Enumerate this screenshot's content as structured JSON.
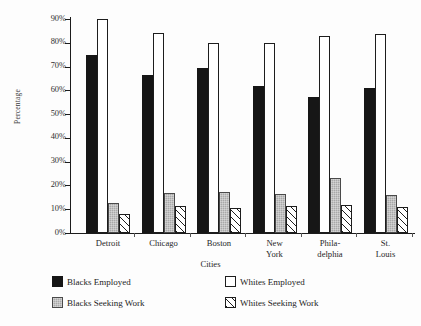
{
  "chart_data": {
    "type": "bar",
    "title": "",
    "xlabel": "Cities",
    "ylabel": "Percentage",
    "categories": [
      "Detroit",
      "Chicago",
      "Boston",
      "New York",
      "Phila-delphia",
      "St. Louis"
    ],
    "category_lines": [
      [
        "Detroit"
      ],
      [
        "Chicago"
      ],
      [
        "Boston"
      ],
      [
        "New",
        "York"
      ],
      [
        "Phila-",
        "delphia"
      ],
      [
        "St.",
        "Louis"
      ]
    ],
    "series": [
      {
        "name": "Blacks Employed",
        "swatch": "sw-blacks-employed",
        "values": [
          75,
          66.5,
          69.5,
          62,
          57,
          61
        ]
      },
      {
        "name": "Whites Employed",
        "swatch": "sw-whites-employed",
        "values": [
          90,
          84,
          80,
          80,
          83,
          83.5
        ]
      },
      {
        "name": "Blacks Seeking Work",
        "swatch": "sw-blacks-seeking",
        "values": [
          12.7,
          16.8,
          17.2,
          16.4,
          23.2,
          15.9
        ]
      },
      {
        "name": "Whites Seeking Work",
        "swatch": "sw-whites-seeking",
        "values": [
          7.8,
          11.2,
          10.7,
          11.5,
          11.9,
          10.8
        ]
      }
    ],
    "ylim": [
      0,
      90
    ],
    "ytick_values": [
      0,
      10,
      20,
      30,
      40,
      50,
      60,
      70,
      80,
      90
    ],
    "ytick_labels": [
      "0%",
      "10%",
      "20%",
      "30%",
      "40%",
      "50%",
      "60%",
      "70%",
      "80%",
      "90%"
    ],
    "grid": false,
    "legend_position": "bottom-left",
    "legend": [
      "Blacks Employed",
      "Whites Employed",
      "Blacks Seeking Work",
      "Whites Seeking Work"
    ],
    "colors": {
      "blacks_employed": "#161616",
      "whites_employed": "#ffffff",
      "blacks_seeking_work": "#a8a8a8",
      "whites_seeking_work": "#ffffff",
      "axis": "#1c1c1c",
      "text": "#262626",
      "background": "#fdfdfd"
    }
  }
}
